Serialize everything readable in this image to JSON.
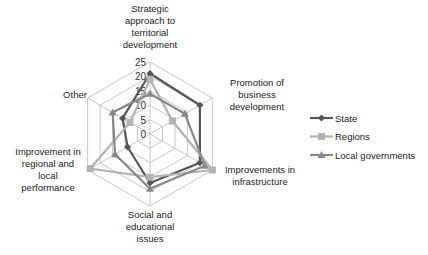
{
  "chart_data": {
    "type": "radar",
    "title": "",
    "categories": [
      "Strategic approach to territorial development",
      "Promotion of business development",
      "Improvements in infrastructure",
      "Social and educational issues",
      "Improvement in regional and local performance",
      "Other"
    ],
    "series": [
      {
        "name": "State",
        "color": "#555555",
        "marker": "diamond",
        "values": [
          21,
          20,
          20,
          17,
          9,
          11
        ]
      },
      {
        "name": "Regions",
        "color": "#b3b3b3",
        "marker": "square",
        "values": [
          19,
          9,
          25,
          15,
          24,
          8
        ]
      },
      {
        "name": "Local governments",
        "color": "#888888",
        "marker": "triangle",
        "values": [
          14,
          14,
          22,
          19,
          14,
          15
        ]
      }
    ],
    "radial_ticks": [
      "0",
      "5",
      "10",
      "15",
      "20",
      "25"
    ],
    "rlim": [
      0,
      25
    ],
    "grid": true,
    "legend_position": "right"
  },
  "labels": {
    "axis_0": "Strategic\napproach to\nterritorial\ndevelopment",
    "axis_1": "Promotion of\nbusiness\ndevelopment",
    "axis_2": "Improvements in\ninfrastructure",
    "axis_3": "Social and\neducational\nissues",
    "axis_4": "Improvement in\nregional and\nlocal\nperformance",
    "axis_5": "Other"
  },
  "legend": {
    "items": [
      {
        "label": "State"
      },
      {
        "label": "Regions"
      },
      {
        "label": "Local governments"
      }
    ]
  }
}
